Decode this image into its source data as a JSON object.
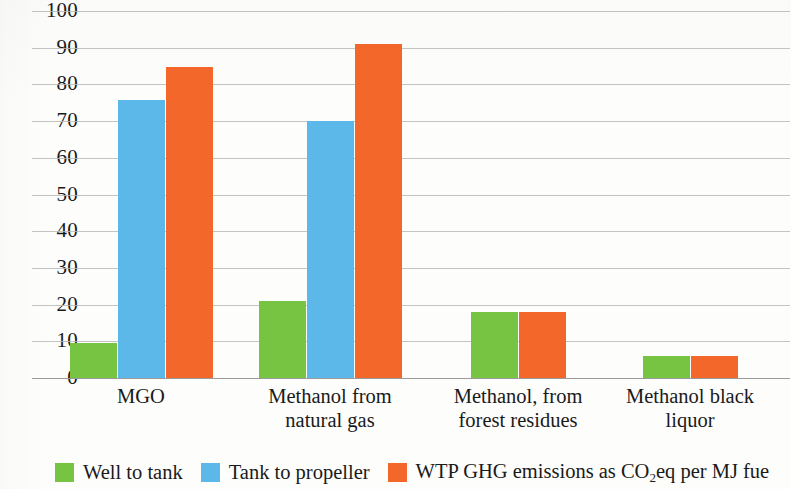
{
  "chart_data": {
    "type": "bar",
    "title": "",
    "subtitle": "",
    "xlabel": "",
    "ylabel": "",
    "ylim": [
      0,
      100
    ],
    "ytick_step": 10,
    "yticks": [
      "100",
      "90",
      "80",
      "70",
      "60",
      "50",
      "40",
      "30",
      "20",
      "10",
      "0"
    ],
    "grid": true,
    "legend_position": "bottom",
    "grouped": true,
    "categories": [
      "MGO",
      "Methanol from natural gas",
      "Methanol, from forest residues",
      "Methanol black liquor"
    ],
    "category_lines": [
      [
        "MGO",
        ""
      ],
      [
        "Methanol from",
        "natural gas"
      ],
      [
        "Methanol, from",
        "forest residues"
      ],
      [
        "Methanol black",
        "liquor"
      ]
    ],
    "series": [
      {
        "name": "Well to tank",
        "color": "#76c442",
        "values": [
          9.5,
          21,
          18,
          6
        ]
      },
      {
        "name": "Tank to propeller",
        "color": "#5bb8e8",
        "values": [
          75.8,
          70,
          null,
          null
        ]
      },
      {
        "name": "WTP GHG emissions as CO2eq per MJ fue",
        "color": "#f4672a",
        "values": [
          84.8,
          91,
          18,
          6
        ]
      }
    ]
  },
  "legend": {
    "items": [
      {
        "label": "Well to tank",
        "color": "#76c442",
        "sub": ""
      },
      {
        "label": "Tank to propeller",
        "color": "#5bb8e8",
        "sub": ""
      },
      {
        "label_pre": "WTP GHG emissions as CO",
        "sub": "2",
        "label_post": "eq per MJ fue",
        "color": "#f4672a"
      }
    ]
  },
  "colors": {
    "well_to_tank": "#76c442",
    "tank_to_propeller": "#5bb8e8",
    "wtp_ghg": "#f4672a",
    "gridline": "#b9b9b9",
    "text": "#1a1a1a",
    "background": "#fdfdfc"
  }
}
